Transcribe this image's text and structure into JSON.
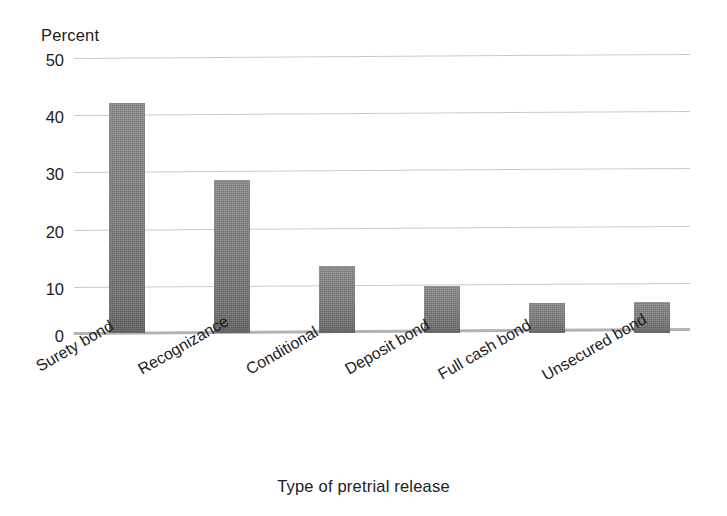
{
  "chart_data": {
    "type": "bar",
    "title": "",
    "subtitle": "",
    "xlabel": "Type of pretrial release",
    "ylabel": "Percent",
    "categories": [
      "Surety bond",
      "Recognizance",
      "Conditional",
      "Deposit bond",
      "Full cash bond",
      "Unsecured bond"
    ],
    "values": [
      42,
      28,
      12.3,
      8.5,
      5.5,
      5.7
    ],
    "series": [
      {
        "name": "Percent",
        "values": [
          42,
          28,
          12.3,
          8.5,
          5.5,
          5.7
        ]
      }
    ],
    "ylim": [
      0,
      50
    ],
    "ytick_labels": [
      "50",
      "40",
      "30",
      "20",
      "10",
      "0"
    ],
    "ytick_values": [
      50,
      40,
      30,
      20,
      10,
      0
    ],
    "grid": true,
    "legend": false,
    "legend_position": "none",
    "annotations": [],
    "colors": {
      "bar_fill": "#7b7b7b",
      "gridline": "#c9c9cd",
      "baseline": "#b2b2b6",
      "text": "#1d1d1d",
      "background": "#ffffff"
    }
  }
}
